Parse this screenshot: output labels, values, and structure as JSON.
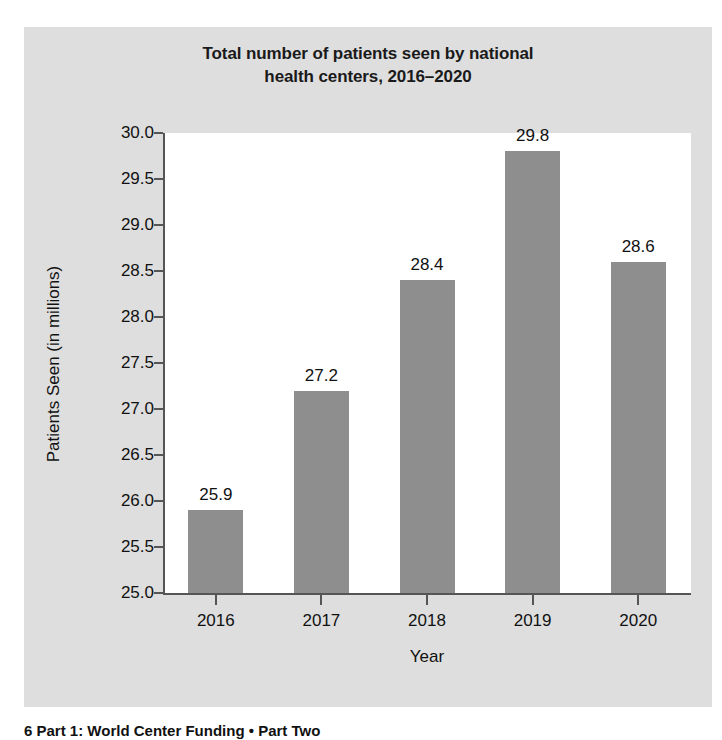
{
  "figure": {
    "caption": "6 Part 1: World Center Funding  •  Part Two"
  },
  "chart_data": {
    "type": "bar",
    "title": "Total number of patients seen by national health centers, 2016–2020",
    "title_lines": [
      "Total number of patients seen by national",
      "health centers, 2016–2020"
    ],
    "xlabel": "Year",
    "ylabel": "Patients Seen (in millions)",
    "categories": [
      "2016",
      "2017",
      "2018",
      "2019",
      "2020"
    ],
    "values": [
      25.9,
      27.2,
      28.4,
      29.8,
      28.6
    ],
    "value_labels": [
      "25.9",
      "27.2",
      "28.4",
      "29.8",
      "28.6"
    ],
    "ylim": [
      25.0,
      30.0
    ],
    "ytick_step": 0.5,
    "yticks": [
      30.0,
      29.5,
      29.0,
      28.5,
      28.0,
      27.5,
      27.0,
      26.5,
      26.0,
      25.5,
      25.0
    ],
    "ytick_labels": [
      "30.0",
      "29.5",
      "29.0",
      "28.5",
      "28.0",
      "27.5",
      "27.0",
      "26.5",
      "26.0",
      "25.5",
      "25.0"
    ],
    "grid": false,
    "legend": null,
    "bar_color": "#8e8e8e",
    "plot_background": "#ffffff",
    "figure_background": "#dedede",
    "text_color": "#111111"
  }
}
